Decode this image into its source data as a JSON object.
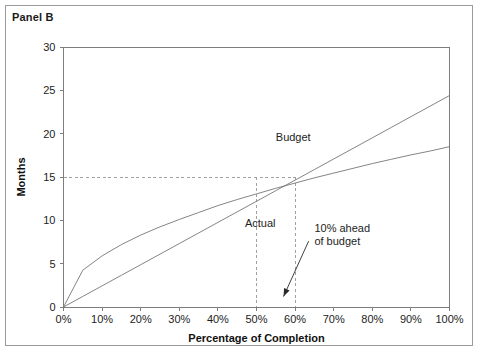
{
  "figure": {
    "panel_title": "Panel B",
    "frame_color": "#9a9a9a",
    "background": "#ffffff"
  },
  "chart_data": {
    "type": "line",
    "title": "Panel B",
    "xlabel": "Percentage of Completion",
    "ylabel": "Months",
    "xlim": [
      0,
      100
    ],
    "ylim": [
      0,
      30
    ],
    "grid": false,
    "legend_position": "inline-labels",
    "x_tick_labels": [
      "0%",
      "10%",
      "20%",
      "30%",
      "40%",
      "50%",
      "60%",
      "70%",
      "80%",
      "90%",
      "100%"
    ],
    "x_tick_values": [
      0,
      10,
      20,
      30,
      40,
      50,
      60,
      70,
      80,
      90,
      100
    ],
    "y_tick_labels": [
      "0",
      "5",
      "10",
      "15",
      "20",
      "25",
      "30"
    ],
    "y_tick_values": [
      0,
      5,
      10,
      15,
      20,
      25,
      30
    ],
    "x": [
      0,
      5,
      10,
      15,
      20,
      25,
      30,
      35,
      40,
      45,
      50,
      55,
      60,
      65,
      70,
      75,
      80,
      85,
      90,
      95,
      100
    ],
    "series": [
      {
        "name": "Budget",
        "color": "#767676",
        "label_x": 55,
        "label_y": 19.2,
        "values": [
          0,
          4.25,
          5.9,
          7.2,
          8.3,
          9.25,
          10.1,
          10.9,
          11.7,
          12.4,
          13.05,
          13.7,
          14.3,
          14.9,
          15.45,
          16.0,
          16.55,
          17.05,
          17.55,
          18.0,
          18.5
        ]
      },
      {
        "name": "Actual",
        "color": "#767676",
        "label_x": 47,
        "label_y": 9.2,
        "values": [
          0,
          1.22,
          2.44,
          3.66,
          4.88,
          6.1,
          7.32,
          8.54,
          9.76,
          10.98,
          12.2,
          13.42,
          14.64,
          15.86,
          17.08,
          18.3,
          19.52,
          20.74,
          21.96,
          23.18,
          24.4
        ]
      }
    ],
    "reference_lines": [
      {
        "name": "months-reference",
        "orientation": "horizontal",
        "value": 15,
        "style": "dashed",
        "color": "#a0a0a0"
      },
      {
        "name": "budget-completion-reference",
        "orientation": "vertical",
        "value": 50,
        "style": "dashed",
        "color": "#a0a0a0"
      },
      {
        "name": "actual-completion-reference",
        "orientation": "vertical",
        "value": 60,
        "style": "dashed",
        "color": "#a0a0a0"
      }
    ],
    "annotations": [
      {
        "name": "ahead-of-budget",
        "line1": "10% ahead",
        "line2": "of budget",
        "text_x": 65,
        "text_y": 8.6,
        "arrow_from_x": 63.5,
        "arrow_from_y": 7.6,
        "arrow_to_x": 57,
        "arrow_to_y": 1.2
      }
    ]
  }
}
